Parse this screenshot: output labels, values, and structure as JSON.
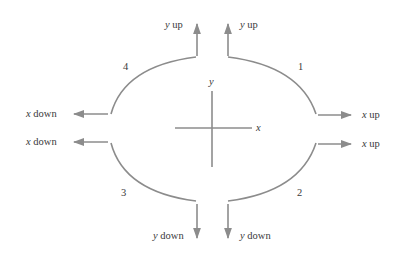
{
  "diagram": {
    "type": "quadrant-motion-diagram",
    "axes": {
      "x_label": "x",
      "y_label": "y"
    },
    "stroke_color": "#8c8c8c",
    "text_color": "#3a3a3a",
    "quadrants": [
      {
        "id": "1",
        "label": "1",
        "horizontal": {
          "var": "x",
          "dir": "up"
        },
        "vertical": {
          "var": "y",
          "dir": "up"
        }
      },
      {
        "id": "2",
        "label": "2",
        "horizontal": {
          "var": "x",
          "dir": "up"
        },
        "vertical": {
          "var": "y",
          "dir": "down"
        }
      },
      {
        "id": "3",
        "label": "3",
        "horizontal": {
          "var": "x",
          "dir": "down"
        },
        "vertical": {
          "var": "y",
          "dir": "down"
        }
      },
      {
        "id": "4",
        "label": "4",
        "horizontal": {
          "var": "x",
          "dir": "down"
        },
        "vertical": {
          "var": "y",
          "dir": "up"
        }
      }
    ],
    "arrow_labels": {
      "q1_vertical": {
        "var": "y",
        "text": " up"
      },
      "q1_horizontal": {
        "var": "x",
        "text": " up"
      },
      "q2_horizontal": {
        "var": "x",
        "text": " up"
      },
      "q2_vertical": {
        "var": "y",
        "text": " down"
      },
      "q3_vertical": {
        "var": "y",
        "text": " down"
      },
      "q3_horizontal": {
        "var": "x",
        "text": " down"
      },
      "q4_horizontal": {
        "var": "x",
        "text": " down"
      },
      "q4_vertical": {
        "var": "y",
        "text": " up"
      }
    }
  }
}
